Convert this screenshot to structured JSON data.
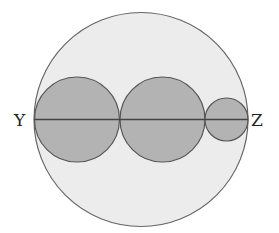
{
  "diagram": {
    "type": "geometry",
    "labels": {
      "left_point": "Y",
      "right_point": "Z"
    },
    "colors": {
      "background": "#ffffff",
      "outer_fill": "#ececec",
      "inner_fill": "#b3b3b3",
      "stroke": "#555555",
      "label": "#222222"
    },
    "outer_circle": {
      "cx": 141,
      "cy": 119.5,
      "r": 107
    },
    "inner_circles": [
      {
        "name": "large-left",
        "cx": 77,
        "cy": 119.5,
        "r": 42.5
      },
      {
        "name": "large-middle",
        "cx": 162.5,
        "cy": 119.5,
        "r": 42.5
      },
      {
        "name": "small-right",
        "cx": 226.5,
        "cy": 119.5,
        "r": 21.5
      }
    ],
    "diameter": {
      "x1": 34,
      "y1": 119.5,
      "x2": 248,
      "y2": 119.5
    }
  }
}
